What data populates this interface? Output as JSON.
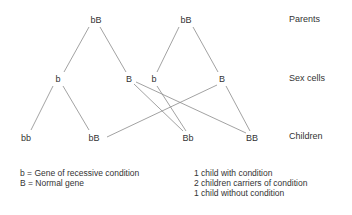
{
  "diagram": {
    "row_labels": {
      "parents": "Parents",
      "sex_cells": "Sex cells",
      "children": "Children"
    },
    "parents": [
      {
        "label": "bB"
      },
      {
        "label": "bB"
      }
    ],
    "sex_cells": [
      {
        "label": "b"
      },
      {
        "label": "B"
      },
      {
        "label": "b"
      },
      {
        "label": "B"
      }
    ],
    "children": [
      {
        "label": "bb"
      },
      {
        "label": "bB"
      },
      {
        "label": "Bb"
      },
      {
        "label": "BB"
      }
    ]
  },
  "key": {
    "lines": [
      "b = Gene of recessive condition",
      "B = Normal gene"
    ]
  },
  "outcomes": {
    "lines": [
      "1 child with condition",
      "2 children carriers of condition",
      "1 child without condition"
    ]
  }
}
